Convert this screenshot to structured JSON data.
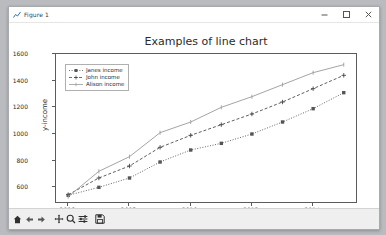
{
  "window": {
    "title": "Figure 1",
    "app_icon": "chart-icon",
    "controls": [
      {
        "name": "minimize-button",
        "glyph": "minimize-icon"
      },
      {
        "name": "maximize-button",
        "glyph": "maximize-icon"
      },
      {
        "name": "close-button",
        "glyph": "close-icon"
      }
    ]
  },
  "toolbar": {
    "buttons": [
      {
        "name": "home-button",
        "icon": "home-icon"
      },
      {
        "name": "back-button",
        "icon": "arrow-left-icon"
      },
      {
        "name": "forward-button",
        "icon": "arrow-right-icon"
      },
      {
        "name": "pan-button",
        "icon": "move-cross-icon"
      },
      {
        "name": "zoom-button",
        "icon": "magnifier-icon"
      },
      {
        "name": "configure-subplots-button",
        "icon": "sliders-icon"
      },
      {
        "name": "save-button",
        "icon": "floppy-disk-icon"
      }
    ]
  },
  "chart_data": {
    "type": "line",
    "title": "Examples of line chart",
    "xlabel": "x-year",
    "ylabel": "y-income",
    "xlim": [
      2005.6,
      2015.4
    ],
    "ylim": [
      490,
      1600
    ],
    "grid": false,
    "legend_position": "upper left",
    "xticks": [
      2006,
      2008,
      2010,
      2012,
      2014
    ],
    "yticks": [
      600,
      800,
      1000,
      1200,
      1400,
      1600
    ],
    "x": [
      2006,
      2007,
      2008,
      2009,
      2010,
      2011,
      2012,
      2013,
      2014,
      2015
    ],
    "series": [
      {
        "name": "Janes income",
        "color": "#555555",
        "linestyle": "dotted",
        "marker": "square",
        "values": [
          540,
          600,
          670,
          790,
          880,
          930,
          1000,
          1090,
          1190,
          1310
        ]
      },
      {
        "name": "John income",
        "color": "#4d4d4d",
        "linestyle": "dashed",
        "marker": "plus",
        "values": [
          545,
          670,
          760,
          900,
          990,
          1070,
          1150,
          1240,
          1340,
          1440
        ]
      },
      {
        "name": "Alison income",
        "color": "#9a9a9a",
        "linestyle": "solid",
        "marker": "tick",
        "values": [
          530,
          720,
          830,
          1010,
          1090,
          1200,
          1280,
          1370,
          1460,
          1520
        ]
      }
    ]
  }
}
